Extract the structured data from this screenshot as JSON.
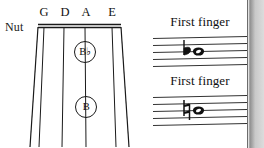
{
  "figure": {
    "type": "violin-fingerboard-and-staff-notation",
    "fingerboard": {
      "nut_label": "Nut",
      "string_labels": [
        "G",
        "D",
        "A",
        "E"
      ],
      "finger_markers": [
        {
          "label": "B♭",
          "string": "A",
          "position": "upper"
        },
        {
          "label": "B",
          "string": "A",
          "position": "lower"
        }
      ]
    },
    "staves": [
      {
        "caption": "First finger",
        "accidental": "♭",
        "accidental_name": "flat",
        "note": "whole-note",
        "note_name": "B♭",
        "staff_lines": 5
      },
      {
        "caption": "First finger",
        "accidental": "♮",
        "accidental_name": "natural",
        "note": "whole-note",
        "note_name": "B",
        "staff_lines": 5
      }
    ]
  },
  "colors": {
    "ink": "#111111",
    "paper": "#ffffff",
    "gutter": "#c9c9c9"
  }
}
